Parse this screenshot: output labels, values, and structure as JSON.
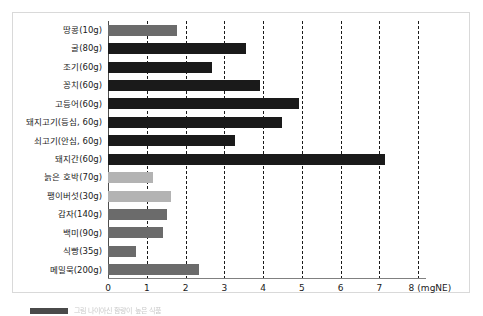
{
  "figure": {
    "background_color": "#ffffff",
    "frame_color": "#d9d9d9"
  },
  "colors": {
    "dark_bar": "#1a1a1a",
    "medium_bar": "#6b6b6b",
    "light_bar": "#b3b3b3",
    "gridline": "#1a1a1a",
    "axis": "#808080",
    "text": "#1a1a1a"
  },
  "axis": {
    "unit_label": "(mgNE)",
    "tick_labels": [
      "0",
      "1",
      "2",
      "3",
      "4",
      "5",
      "6",
      "7",
      "8"
    ],
    "tick_values": [
      0,
      1,
      2,
      3,
      4,
      5,
      6,
      7,
      8
    ]
  },
  "caption": {
    "text": "그림 나이아신 함량이 높은 식품"
  },
  "chart_data": {
    "type": "bar",
    "orientation": "horizontal",
    "title": "",
    "subtitle": "",
    "xlabel": "(mgNE)",
    "ylabel": "",
    "xlim": [
      0,
      8
    ],
    "grid": true,
    "grid_axis": "x",
    "legend": false,
    "categories": [
      "땅콩(10g)",
      "굴(80g)",
      "조기(60g)",
      "꽁치(60g)",
      "고등어(60g)",
      "돼지고기(등심, 60g)",
      "쇠고기(안심, 60g)",
      "돼지간(60g)",
      "늙은 호박(70g)",
      "팽이버섯(30g)",
      "감자(140g)",
      "백미(90g)",
      "식빵(35g)",
      "메밀묵(200g)"
    ],
    "values": [
      1.78,
      3.55,
      2.68,
      3.93,
      4.92,
      4.48,
      3.28,
      7.14,
      1.15,
      1.62,
      1.52,
      1.41,
      0.72,
      2.35
    ],
    "bar_colors": [
      "#6b6b6b",
      "#1a1a1a",
      "#1a1a1a",
      "#1a1a1a",
      "#1a1a1a",
      "#1a1a1a",
      "#1a1a1a",
      "#1a1a1a",
      "#b3b3b3",
      "#b3b3b3",
      "#6b6b6b",
      "#6b6b6b",
      "#6b6b6b",
      "#6b6b6b"
    ]
  }
}
